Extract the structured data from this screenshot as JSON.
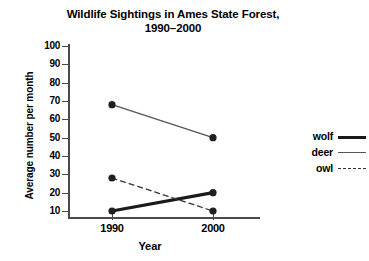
{
  "chart_data": {
    "type": "line",
    "title": "Wildlife Sightings in Ames State Forest, 1990–2000",
    "title_line1": "Wildlife Sightings in Ames State Forest,",
    "title_line2": "1990–2000",
    "xlabel": "Year",
    "ylabel": "Average number per month",
    "categories": [
      "1990",
      "2000"
    ],
    "x": [
      1990,
      2000
    ],
    "ylim": [
      0,
      100
    ],
    "yticks": [
      100,
      90,
      80,
      70,
      60,
      50,
      40,
      30,
      20,
      10
    ],
    "ytick_labels": [
      "100",
      "90",
      "80",
      "70",
      "60",
      "50",
      "40",
      "30",
      "20",
      "10"
    ],
    "grid": false,
    "legend_position": "right",
    "series": [
      {
        "name": "wolf",
        "values": [
          10,
          20
        ],
        "style": "solid-thick",
        "color": "#1a1a1a",
        "width": 3.2,
        "markers": true
      },
      {
        "name": "deer",
        "values": [
          68,
          50
        ],
        "style": "solid-thin",
        "color": "#555555",
        "width": 1.3,
        "markers": true
      },
      {
        "name": "owl",
        "values": [
          28,
          10
        ],
        "style": "dashed",
        "color": "#333333",
        "width": 1.3,
        "markers": true
      }
    ]
  },
  "legend": {
    "items": [
      {
        "label": "wolf",
        "style": "solid-thick"
      },
      {
        "label": "deer",
        "style": "solid-thin"
      },
      {
        "label": "owl",
        "style": "dashed"
      }
    ]
  },
  "colors": {
    "axis": "#4a4a4a",
    "wolf": "#1a1a1a",
    "deer": "#555555",
    "owl": "#333333",
    "background": "#ffffff"
  }
}
